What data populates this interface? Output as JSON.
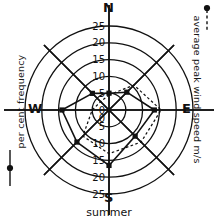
{
  "caption": "summer",
  "compass": {
    "north": "N",
    "south": "S",
    "east": "E",
    "west": "W"
  },
  "legends": {
    "left": {
      "label": "per cent frequency",
      "symbol": "solid-line-with-dot"
    },
    "right": {
      "label": "average peak wind speed m/s",
      "symbol": "dotted-line-with-dot"
    }
  },
  "axis": {
    "upper_ticks": [
      "25",
      "20",
      "15",
      "10",
      "5",
      "0"
    ],
    "lower_ticks": [
      "0",
      "5",
      "10",
      "15",
      "20",
      "25"
    ]
  },
  "chart_data": {
    "type": "line",
    "title": "summer",
    "subtype": "wind-rose",
    "xlabel": "",
    "ylabel": "per cent frequency",
    "rlim": [
      0,
      25
    ],
    "rticks": [
      0,
      5,
      10,
      15,
      20,
      25
    ],
    "grid": true,
    "legend_position": "sides",
    "categories": [
      "N",
      "NE",
      "E",
      "SE",
      "S",
      "SW",
      "W",
      "NW"
    ],
    "series": [
      {
        "name": "per cent frequency",
        "style": "solid",
        "marker": "filled-square",
        "values": [
          5.0,
          7.5,
          13.5,
          11.0,
          16.5,
          13.5,
          14.0,
          7.0
        ]
      },
      {
        "name": "average peak wind speed m/s",
        "style": "dotted",
        "marker": "none",
        "values": [
          4.5,
          10.5,
          15.5,
          13.5,
          13.0,
          11.0,
          5.0,
          3.5
        ]
      }
    ],
    "annotations": [
      "N",
      "S",
      "E",
      "W",
      "summer"
    ]
  }
}
